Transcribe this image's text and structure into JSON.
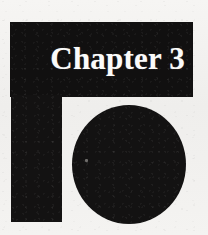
{
  "page": {
    "width": 208,
    "height": 235,
    "background_color": "#f2f1ef",
    "ink_color": "#131212",
    "title_color": "#fbfbfa"
  },
  "chapter_opener": {
    "title": "Chapter 3",
    "decoration": {
      "bar_name": "horizontal-rule-bar",
      "stem_name": "vertical-rule-stem",
      "disc_name": "solid-circle"
    },
    "artifact": {
      "speck_label": "scan-speck"
    }
  }
}
